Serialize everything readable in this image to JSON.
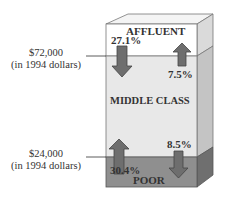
{
  "diagram": {
    "bands": [
      {
        "id": "affluent",
        "label": "AFFLUENT",
        "color": "#ffffff"
      },
      {
        "id": "middle",
        "label": "MIDDLE CLASS",
        "color": "#e8e8e8"
      },
      {
        "id": "poor",
        "label": "POOR",
        "color": "#8f8f8f"
      }
    ],
    "thresholds": [
      {
        "amount": "$72,000",
        "note": "(in 1994 dollars)"
      },
      {
        "amount": "$24,000",
        "note": "(in 1994 dollars)"
      }
    ],
    "flows": [
      {
        "from": "affluent",
        "to": "middle",
        "direction": "down",
        "value": "27.1%"
      },
      {
        "from": "middle",
        "to": "affluent",
        "direction": "up",
        "value": "7.5%"
      },
      {
        "from": "poor",
        "to": "middle",
        "direction": "up",
        "value": "30.4%"
      },
      {
        "from": "middle",
        "to": "poor",
        "direction": "down",
        "value": "8.5%"
      }
    ],
    "colors": {
      "arrow_fill": "#6e6e6e",
      "arrow_stroke": "#444444",
      "side_affluent": "#d9d9d9",
      "side_middle": "#c4c4c4",
      "side_poor": "#6f6f6f",
      "top_face": "#f4f4f4"
    }
  }
}
